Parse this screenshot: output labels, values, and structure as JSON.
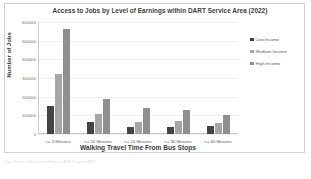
{
  "chart_data": {
    "type": "bar",
    "title": "Access to Jobs by Level of Earnings within DART Service Area (2022)",
    "xlabel": "Walking Travel Time From Bus Stops",
    "ylabel": "Number of Jobs",
    "categories": [
      "<= 5 Minutes",
      "<= 10 Minutes",
      "<= 15 Minutes",
      "<= 30 Minutes",
      "<= 60 Minutes"
    ],
    "series": [
      {
        "name": "Low Income",
        "color": "#444444",
        "values": [
          150000,
          62000,
          38000,
          40000,
          42000
        ]
      },
      {
        "name": "Medium Income",
        "color": "#a6a6a6",
        "values": [
          320000,
          105000,
          63000,
          68000,
          58000
        ]
      },
      {
        "name": "High Income",
        "color": "#8f8f8f",
        "values": [
          565000,
          190000,
          142000,
          127000,
          103000
        ]
      }
    ],
    "ylim": [
      0,
      600000
    ],
    "yticks": [
      "0",
      "100000",
      "200000",
      "300000",
      "400000",
      "500000",
      "600000"
    ],
    "grid": true,
    "legend_position": "right"
  },
  "footer": {
    "source_note": "Data Source: U.S. Census Bureau, LEHD Program 2019"
  }
}
